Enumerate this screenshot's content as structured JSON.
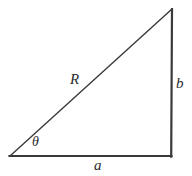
{
  "figure": {
    "type": "geometry-diagram",
    "shape": "right-triangle",
    "background_color": "#ffffff",
    "stroke_color": "#3a3a3a",
    "label_color": "#2b2b2b"
  },
  "labels": {
    "hypotenuse": "R",
    "vertical_leg": "b",
    "horizontal_leg": "a",
    "angle": "θ"
  },
  "geometry": {
    "vertices": {
      "origin": [
        10,
        156
      ],
      "bottom_right": [
        171,
        156
      ],
      "apex": [
        172,
        9
      ]
    },
    "edges": [
      {
        "name": "horizontal-leg",
        "from": [
          10,
          156
        ],
        "to": [
          171,
          156
        ],
        "label": "a",
        "width": 2.2
      },
      {
        "name": "vertical-leg",
        "from": [
          171,
          156
        ],
        "to": [
          172,
          9
        ],
        "label": "b",
        "width": 2.2
      },
      {
        "name": "hypotenuse",
        "from": [
          10,
          156
        ],
        "to": [
          172,
          9
        ],
        "label": "R",
        "width": 1.4
      }
    ],
    "angle_vertex": [
      10,
      156
    ]
  }
}
